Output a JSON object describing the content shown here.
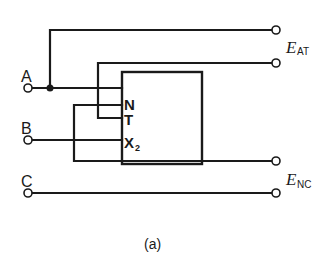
{
  "diagram": {
    "caption": "(a)",
    "colors": {
      "line": "#1a1a1a",
      "background": "#ffffff",
      "terminal_fill": "#ffffff"
    },
    "inputs": [
      {
        "id": "A",
        "label": "A"
      },
      {
        "id": "B",
        "label": "B"
      },
      {
        "id": "C",
        "label": "C"
      }
    ],
    "box_terminals": [
      {
        "id": "N",
        "label": "N"
      },
      {
        "id": "T",
        "label": "T"
      },
      {
        "id": "X2",
        "label": "X",
        "subscript": "2"
      }
    ],
    "outputs": [
      {
        "id": "E_AT",
        "symbol": "E",
        "subscript": "AT"
      },
      {
        "id": "E_NC",
        "symbol": "E",
        "subscript": "NC"
      }
    ]
  }
}
